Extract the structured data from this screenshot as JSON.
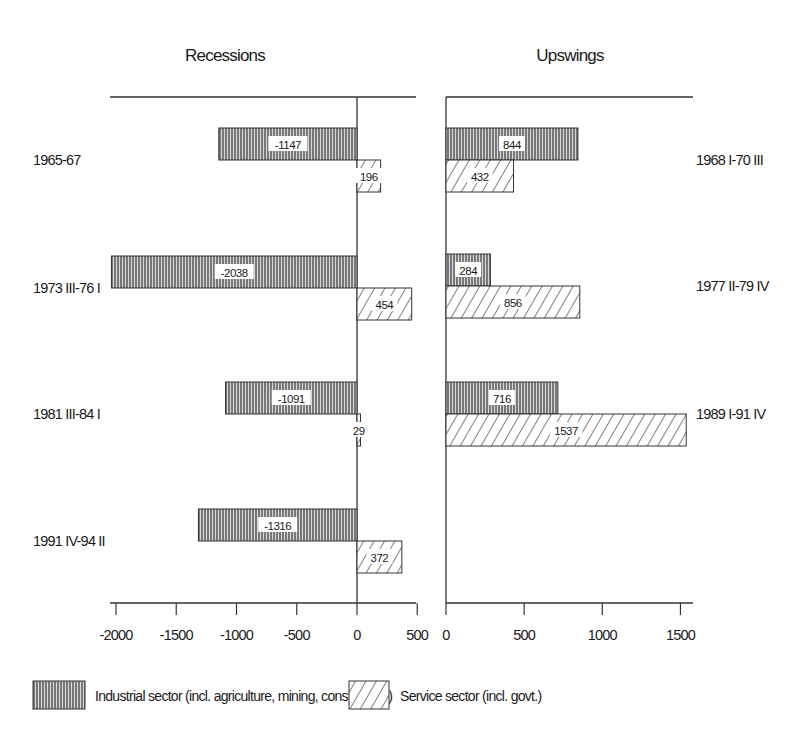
{
  "panels": {
    "left_title": "Recessions",
    "right_title": "Upswings"
  },
  "legend": {
    "industrial": "Industrial sector (incl. agriculture, mining, construction)",
    "service": "Service sector (incl. govt.)"
  },
  "axes": {
    "left_ticks": [
      "-2000",
      "-1500",
      "-1000",
      "-500",
      "0",
      "500"
    ],
    "right_ticks": [
      "0",
      "500",
      "1000",
      "1500"
    ]
  },
  "chart_data": [
    {
      "type": "bar",
      "orientation": "horizontal",
      "title": "Recessions",
      "categories": [
        "1965-67",
        "1973 III-76 I",
        "1981 III-84 I",
        "1991 IV-94 II"
      ],
      "series": [
        {
          "name": "Industrial sector (incl. agriculture, mining, construction)",
          "pattern": "vertical-lines",
          "values": [
            -1147,
            -2038,
            -1091,
            -1316
          ]
        },
        {
          "name": "Service sector (incl. govt.)",
          "pattern": "diagonal-hatch",
          "values": [
            196,
            454,
            29,
            372
          ]
        }
      ],
      "xlim": [
        -2050,
        500
      ],
      "xticks": [
        -2000,
        -1500,
        -1000,
        -500,
        0,
        500
      ],
      "grid": false
    },
    {
      "type": "bar",
      "orientation": "horizontal",
      "title": "Upswings",
      "categories": [
        "1968 I-70 III",
        "1977 II-79 IV",
        "1989 I-91 IV"
      ],
      "series": [
        {
          "name": "Industrial sector (incl. agriculture, mining, construction)",
          "pattern": "vertical-lines",
          "values": [
            844,
            284,
            716
          ]
        },
        {
          "name": "Service sector (incl. govt.)",
          "pattern": "diagonal-hatch",
          "values": [
            432,
            856,
            1537
          ]
        }
      ],
      "xlim": [
        0,
        1600
      ],
      "xticks": [
        0,
        500,
        1000,
        1500
      ],
      "grid": false,
      "legend_position": "bottom"
    }
  ]
}
